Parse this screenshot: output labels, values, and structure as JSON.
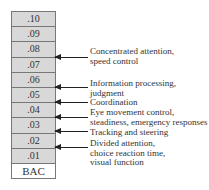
{
  "scale": {
    "levels": [
      ".10",
      ".09",
      ".08",
      ".07",
      ".06",
      ".05",
      ".04",
      ".03",
      ".02",
      ".01"
    ],
    "label": "BAC"
  },
  "annotations": [
    {
      "between": [
        ".08",
        ".07"
      ],
      "lines": [
        "Concentrated attention,",
        "speed control"
      ]
    },
    {
      "between": [
        ".06",
        ".05"
      ],
      "lines": [
        "Information processing,",
        "judgment"
      ]
    },
    {
      "between": [
        ".05",
        ".04"
      ],
      "lines": [
        "Coordination"
      ]
    },
    {
      "between": [
        ".04",
        ".03"
      ],
      "lines": [
        "Eye movement control,",
        "steadiness, emergency responses"
      ]
    },
    {
      "between": [
        ".03",
        ".02"
      ],
      "lines": [
        "Tracking and steering"
      ]
    },
    {
      "between": [
        ".02",
        ".01"
      ],
      "lines": [
        "Divided attention,",
        "choice reaction time,",
        "visual function"
      ]
    }
  ]
}
